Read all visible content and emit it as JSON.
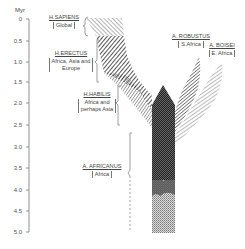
{
  "axis": {
    "title": "Myr",
    "ticks": [
      "0",
      "0.5",
      "1.0",
      "1.5",
      "2.0",
      "2.5",
      "3.0",
      "3.5",
      "4.0",
      "4.5",
      "5.0"
    ]
  },
  "taxa": {
    "sapiens": {
      "name": "H.SAPIENS",
      "region": "Global"
    },
    "erectus": {
      "name": "H.ERECTUS",
      "region_line1": "Africa, Asia and",
      "region_line2": "Europe"
    },
    "habilis": {
      "name": "H.HABILIS",
      "region_line1": "Africa and",
      "region_line2": "perhaps Asia"
    },
    "africanus": {
      "name": "A. AFRICANUS",
      "region": "Africa"
    },
    "robustus": {
      "name": "A. ROBUSTUS",
      "region": "S.Africa"
    },
    "boisei": {
      "name": "A. BOISEI",
      "region": "E. Africa"
    }
  },
  "colors": {
    "ink": "#2a2a2a",
    "axis": "#777777",
    "background": "#ffffff"
  }
}
